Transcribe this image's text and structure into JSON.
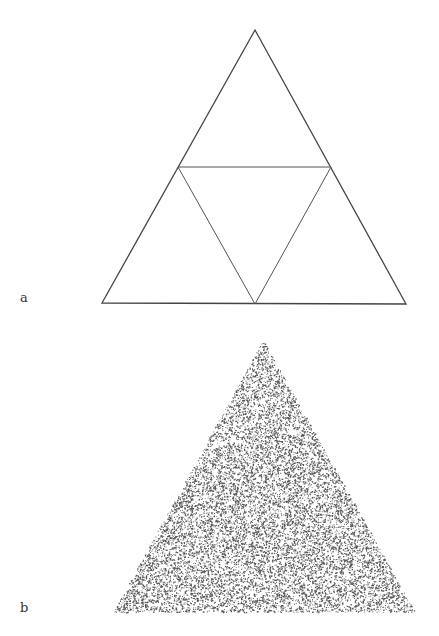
{
  "figure": {
    "panels": [
      {
        "label": "a",
        "description": "Sierpinski triangle first subdivision (outline)",
        "outer_triangle": [
          [
            255,
            30
          ],
          [
            102,
            303
          ],
          [
            406,
            304
          ]
        ],
        "inner_triangle": [
          [
            178,
            167
          ],
          [
            331,
            167
          ],
          [
            255,
            304
          ]
        ],
        "stroke_color": "#444444"
      },
      {
        "label": "b",
        "description": "Random point cloud filling a triangle",
        "triangle": [
          [
            263,
            340
          ],
          [
            113,
            612
          ],
          [
            415,
            612
          ]
        ],
        "dot_color": "#222222",
        "dot_count": 14000
      }
    ]
  }
}
